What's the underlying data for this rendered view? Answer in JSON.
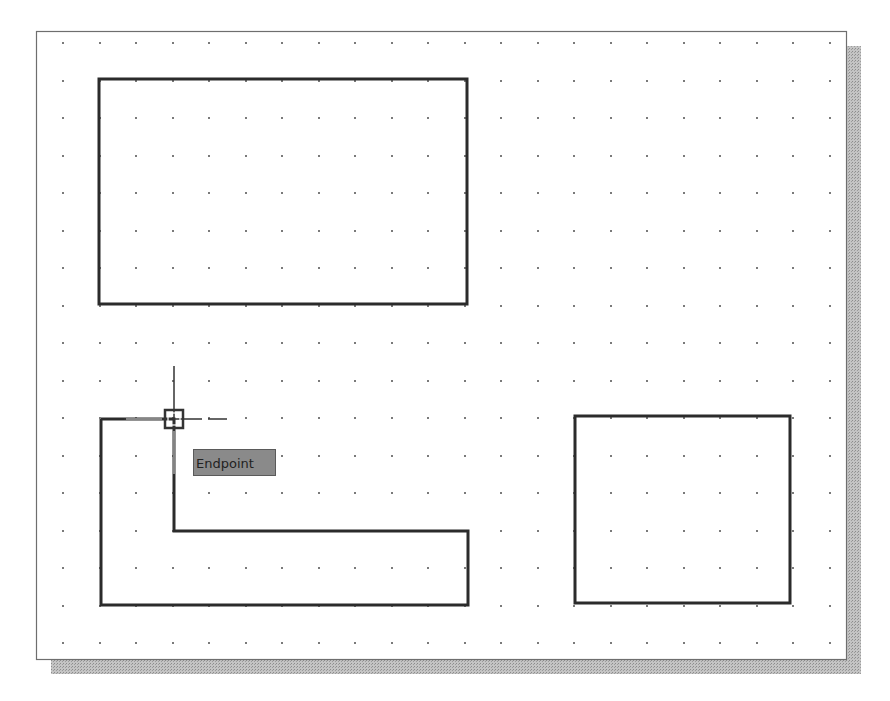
{
  "viewport": {
    "frame": {
      "x": 36,
      "y": 31,
      "w": 810,
      "h": 628
    },
    "frame_border_color": "#6e6e6e",
    "shadow": {
      "offset_x": 15,
      "offset_y": 15,
      "color": "#b4b4b4"
    },
    "background": "#ffffff"
  },
  "grid": {
    "origin_x": 63,
    "origin_y": 43,
    "step_x": 36.5,
    "step_y": 37.5,
    "cols": 22,
    "rows": 17,
    "dot_color": "#7a7a7a"
  },
  "objects": {
    "line_color": "#2b2b2b",
    "line_width": 3,
    "rectangle_top": {
      "points": [
        [
          99,
          79
        ],
        [
          467,
          79
        ],
        [
          467,
          304
        ],
        [
          99,
          304
        ]
      ]
    },
    "l_shape": {
      "points": [
        [
          101,
          419
        ],
        [
          174,
          419
        ],
        [
          174,
          531
        ],
        [
          468,
          531
        ],
        [
          468,
          605
        ],
        [
          101,
          605
        ]
      ]
    },
    "rectangle_right": {
      "points": [
        [
          575,
          416
        ],
        [
          790,
          416
        ],
        [
          790,
          603
        ],
        [
          575,
          603
        ]
      ]
    }
  },
  "cursor": {
    "x": 174,
    "y": 419,
    "arm_up": 53,
    "arm_right": 53,
    "box_size": 18,
    "color": "#333333"
  },
  "osnap_tooltip": {
    "label": "Endpoint",
    "x": 193,
    "y": 449,
    "w": 83
  }
}
